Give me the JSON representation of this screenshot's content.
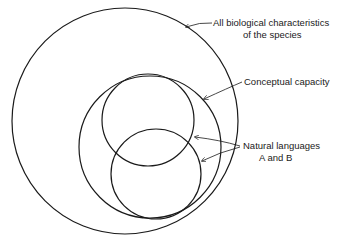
{
  "diagram": {
    "type": "nested-circles",
    "labels": {
      "bio_line1": "All biological characteristics",
      "bio_line2": "of the species",
      "conceptual": "Conceptual capacity",
      "lang_line1": "Natural languages",
      "lang_line2": "A and B"
    },
    "colors": {
      "stroke": "#1a1a1a",
      "background": "#ffffff"
    }
  }
}
